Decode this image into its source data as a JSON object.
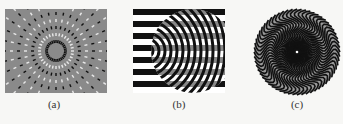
{
  "figure": {
    "panels": [
      {
        "id": "a",
        "caption": "(a)",
        "description": "radial dashed-line pattern on gray background"
      },
      {
        "id": "b",
        "caption": "(b)",
        "description": "horizontal black-white stripes with circular checkered distortion"
      },
      {
        "id": "c",
        "caption": "(c)",
        "description": "circular wavy radial pattern"
      }
    ]
  },
  "colors": {
    "background": "#f7f7f5",
    "gray": "#8a8a8a",
    "black": "#111111",
    "white": "#ffffff"
  }
}
